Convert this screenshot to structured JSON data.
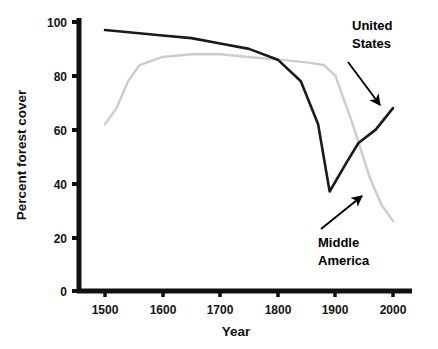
{
  "chart_data": {
    "type": "line",
    "title": "",
    "xlabel": "Year",
    "ylabel": "Percent forest cover",
    "xlim": [
      1440,
      2020
    ],
    "ylim": [
      0,
      104
    ],
    "xticks": [
      1500,
      1600,
      1700,
      1800,
      1900,
      2000
    ],
    "yticks": [
      0,
      20,
      40,
      60,
      80,
      100
    ],
    "grid": false,
    "legend_position": "inline-annotations",
    "series": [
      {
        "name": "United States",
        "color": "#1a1a1a",
        "linewidth": 2.6,
        "x": [
          1500,
          1550,
          1600,
          1650,
          1700,
          1750,
          1800,
          1840,
          1870,
          1890,
          1920,
          1940,
          1970,
          2000
        ],
        "y": [
          97,
          96,
          95,
          94,
          92,
          90,
          86,
          78,
          62,
          37,
          48,
          55,
          60,
          68
        ]
      },
      {
        "name": "Middle America",
        "color": "#cccccc",
        "linewidth": 2.4,
        "x": [
          1500,
          1520,
          1540,
          1560,
          1600,
          1650,
          1700,
          1750,
          1800,
          1850,
          1880,
          1900,
          1930,
          1960,
          1980,
          2000
        ],
        "y": [
          62,
          68,
          78,
          84,
          87,
          88,
          88,
          87,
          86,
          85,
          84,
          80,
          62,
          42,
          32,
          26
        ]
      }
    ],
    "annotations": [
      {
        "text_lines": [
          "United",
          "States"
        ],
        "label_x": 352,
        "label_y": 24,
        "arrow_from_x": 346,
        "arrow_from_y": 62,
        "arrow_to_x": 381,
        "arrow_to_y": 107,
        "points_to_series": "United States"
      },
      {
        "text_lines": [
          "Middle",
          "America"
        ],
        "label_x": 318,
        "label_y": 229,
        "arrow_from_x": 320,
        "arrow_from_y": 227,
        "arrow_to_x": 364,
        "arrow_to_y": 194,
        "points_to_series": "Middle America"
      }
    ]
  },
  "axes": {
    "y_title": "Percent forest cover",
    "x_title": "Year",
    "y_tick_labels": [
      "100",
      "80",
      "60",
      "40",
      "20",
      "0"
    ],
    "x_tick_labels": [
      "1500",
      "1600",
      "1700",
      "1800",
      "1900",
      "2000"
    ]
  },
  "labels": {
    "united_states_line1": "United",
    "united_states_line2": "States",
    "middle_america_line1": "Middle",
    "middle_america_line2": "America"
  },
  "colors": {
    "axis": "#111111",
    "us_line": "#1a1a1a",
    "ma_line": "#cfcfcf",
    "background": "#ffffff"
  }
}
